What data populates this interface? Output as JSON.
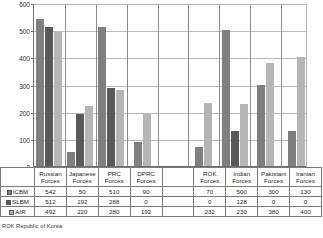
{
  "chart_data": {
    "type": "bar",
    "title": "",
    "xlabel": "",
    "ylabel": "",
    "ylim": [
      0,
      600
    ],
    "yticks": [
      0,
      100,
      200,
      300,
      400,
      500,
      600
    ],
    "grid": true,
    "legend_position": "table-left",
    "categories": [
      "Russian Forces",
      "Japanese Forces",
      "PRC Forces",
      "DPRC Forces",
      "",
      "ROK Forces",
      "Indian Forces",
      "Pakistani Forces",
      "Iranian Forces"
    ],
    "series": [
      {
        "name": "ICBM",
        "color": "#7f7f7f",
        "values": [
          542,
          50,
          510,
          90,
          null,
          70,
          500,
          300,
          130
        ]
      },
      {
        "name": "SLBM",
        "color": "#595959",
        "values": [
          512,
          192,
          288,
          0,
          null,
          0,
          128,
          0,
          0
        ]
      },
      {
        "name": "AIR",
        "color": "#b5b5b5",
        "values": [
          492,
          220,
          280,
          192,
          null,
          232,
          230,
          380,
          400
        ]
      }
    ],
    "annotations": [
      "ROK  Republic of Korea"
    ]
  },
  "axis": {
    "ytick_labels": [
      "600",
      "500",
      "400",
      "300",
      "200",
      "100",
      "0"
    ]
  },
  "table": {
    "headers": [
      {
        "line1": "Russian",
        "line2": "Forces"
      },
      {
        "line1": "Japanese",
        "line2": "Forces"
      },
      {
        "line1": "PRC",
        "line2": "Forces"
      },
      {
        "line1": "DPRC",
        "line2": "Forces"
      },
      {
        "line1": "",
        "line2": ""
      },
      {
        "line1": "ROK",
        "line2": "Forces"
      },
      {
        "line1": "Indian",
        "line2": "Forces"
      },
      {
        "line1": "Pakistani",
        "line2": "Forces"
      },
      {
        "line1": "Iranian",
        "line2": "Forces"
      }
    ],
    "rows": [
      {
        "label": "ICBM",
        "values": [
          "542",
          "50",
          "510",
          "90",
          "",
          "70",
          "500",
          "300",
          "130"
        ]
      },
      {
        "label": "SLBM",
        "values": [
          "512",
          "192",
          "288",
          "0",
          "",
          "0",
          "128",
          "0",
          "0"
        ]
      },
      {
        "label": "AIR",
        "values": [
          "492",
          "220",
          "280",
          "192",
          "",
          "232",
          "230",
          "380",
          "400"
        ]
      }
    ]
  },
  "footnote": "ROK  Republic of Korea"
}
